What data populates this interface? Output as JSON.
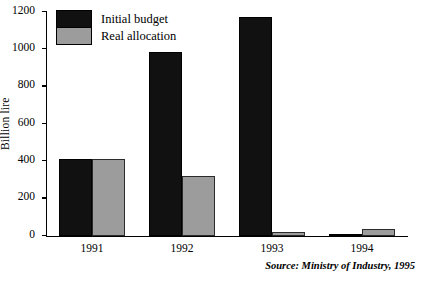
{
  "chart_data": {
    "type": "bar",
    "title": "",
    "xlabel": "",
    "ylabel": "Billion lire",
    "categories": [
      "1991",
      "1992",
      "1993",
      "1994"
    ],
    "series": [
      {
        "name": "Initial budget",
        "values": [
          415,
          985,
          1175,
          10
        ]
      },
      {
        "name": "Real allocation",
        "values": [
          415,
          320,
          20,
          35
        ]
      }
    ],
    "ylim": [
      0,
      1200
    ],
    "yticks": [
      0,
      200,
      400,
      600,
      800,
      1000,
      1200
    ],
    "ytick_labels": [
      "0",
      "200",
      "400",
      "600",
      "800",
      "1000",
      "1200"
    ],
    "grid": false,
    "legend_position": "top-left",
    "colors": {
      "initial_budget": "#111111",
      "real_allocation": "#9c9c9c",
      "axis": "#000000",
      "background": "#ffffff"
    },
    "annotations": [
      "Source: Ministry of Industry, 1995"
    ]
  },
  "source_note": "Source: Ministry of Industry, 1995"
}
